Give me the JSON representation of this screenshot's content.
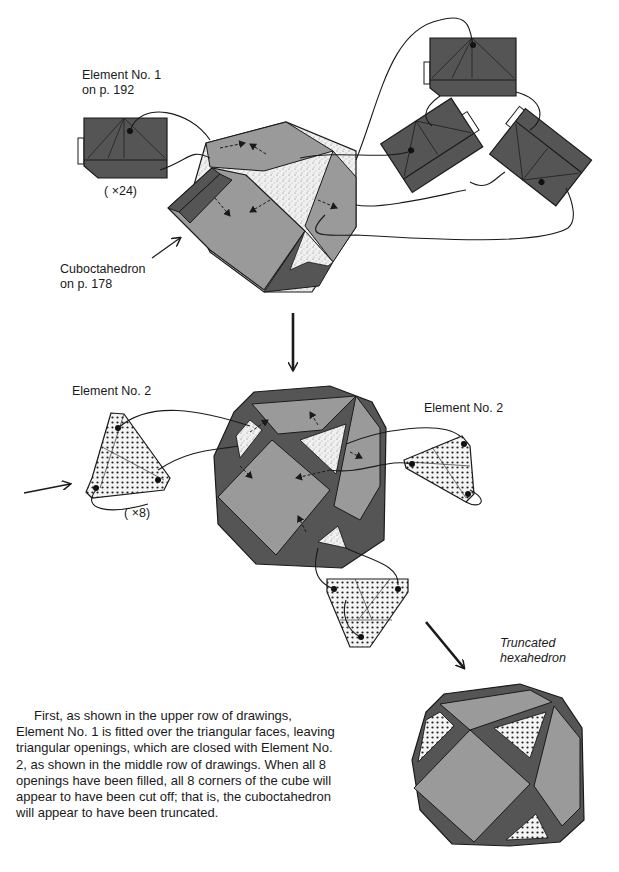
{
  "labels": {
    "element1": [
      "Element No. 1",
      "on p. 192"
    ],
    "count24": "( ×24)",
    "cuboctahedron": [
      "Cuboctahedron",
      "on p. 178"
    ],
    "element2_left": "Element No. 2",
    "element2_right": "Element No. 2",
    "count8": "( ×8)",
    "truncated": [
      "Truncated",
      "hexahedron"
    ]
  },
  "description": "First, as shown in the upper row of drawings, Element No. 1 is fitted over the triangular faces, leaving triangular openings, which are closed with Element No. 2, as shown in the middle row of drawings. When all 8 openings have been filled, all 8 corners of the cube will appear to have been cut off; that is, the cuboctahedron will appear to have been truncated.",
  "colors": {
    "dark_unit": "#555555",
    "light_face": "#9a9a9a",
    "outline": "#1a1a1a",
    "background": "#ffffff"
  },
  "icons": [
    "arrow-down-icon",
    "arrow-diagonal-icon",
    "arrow-right-icon",
    "pointer-arrow-icon"
  ]
}
